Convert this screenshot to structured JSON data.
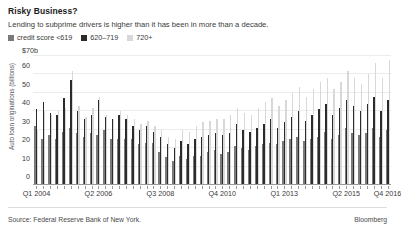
{
  "header": {
    "title": "Risky Business?",
    "subtitle": "Lending to subprime drivers is higher than it has been in more than a decade."
  },
  "legend": {
    "items": [
      {
        "label": "credit score <619",
        "color": "#7a7a7a"
      },
      {
        "label": "620–719",
        "color": "#2b2b2b"
      },
      {
        "label": "720+",
        "color": "#d8d8d8"
      }
    ]
  },
  "footer": {
    "source": "Source: Federal Reserve Bank of New York.",
    "brand": "Bloomberg"
  },
  "chart_data": {
    "type": "bar",
    "title": "Risky Business?",
    "subtitle": "Lending to subprime drivers is higher than it has been in more than a decade.",
    "xlabel": "",
    "ylabel": "Auto loan originations (billions)",
    "ylim": [
      0,
      70
    ],
    "yticks": [
      0,
      10,
      20,
      30,
      40,
      50,
      60,
      70
    ],
    "ytick_labels": [
      "0",
      "10",
      "20",
      "30",
      "40",
      "50",
      "60",
      "$70b"
    ],
    "grid": true,
    "legend_position": "top-left",
    "bar_mode": "grouped",
    "categories": [
      "Q1 2004",
      "Q2 2004",
      "Q3 2004",
      "Q4 2004",
      "Q1 2005",
      "Q2 2005",
      "Q3 2005",
      "Q4 2005",
      "Q1 2006",
      "Q2 2006",
      "Q3 2006",
      "Q4 2006",
      "Q1 2007",
      "Q2 2007",
      "Q3 2007",
      "Q4 2007",
      "Q1 2008",
      "Q2 2008",
      "Q3 2008",
      "Q4 2008",
      "Q1 2009",
      "Q2 2009",
      "Q3 2009",
      "Q4 2009",
      "Q1 2010",
      "Q2 2010",
      "Q3 2010",
      "Q4 2010",
      "Q1 2011",
      "Q2 2011",
      "Q3 2011",
      "Q4 2011",
      "Q1 2012",
      "Q2 2012",
      "Q3 2012",
      "Q4 2012",
      "Q1 2013",
      "Q2 2013",
      "Q3 2013",
      "Q4 2013",
      "Q1 2014",
      "Q2 2014",
      "Q3 2014",
      "Q4 2014",
      "Q1 2015",
      "Q2 2015",
      "Q3 2015",
      "Q4 2015",
      "Q1 2016",
      "Q2 2016",
      "Q3 2016",
      "Q4 2016"
    ],
    "xtick_labels": [
      {
        "label": "Q1 2004",
        "index": 0
      },
      {
        "label": "Q2 2006",
        "index": 9
      },
      {
        "label": "Q3 2008",
        "index": 18
      },
      {
        "label": "Q4 2010",
        "index": 27
      },
      {
        "label": "Q1 2013",
        "index": 36
      },
      {
        "label": "Q2 2015",
        "index": 45
      },
      {
        "label": "Q4 2016",
        "index": 51
      }
    ],
    "series": [
      {
        "name": "credit score <619",
        "color": "#7a7a7a",
        "values": [
          32,
          25,
          27,
          25,
          29,
          31,
          28,
          26,
          28,
          27,
          30,
          25,
          25,
          25,
          25,
          22,
          23,
          23,
          18,
          15,
          13,
          16,
          14,
          16,
          16,
          18,
          19,
          17,
          18,
          21,
          20,
          19,
          21,
          22,
          23,
          22,
          24,
          25,
          26,
          24,
          25,
          26,
          29,
          25,
          27,
          31,
          28,
          27,
          28,
          31,
          26,
          30
        ]
      },
      {
        "name": "620–719",
        "color": "#2b2b2b",
        "values": [
          41,
          45,
          39,
          38,
          47,
          57,
          40,
          36,
          38,
          46,
          37,
          36,
          38,
          36,
          32,
          30,
          32,
          29,
          26,
          22,
          20,
          24,
          22,
          25,
          26,
          27,
          28,
          27,
          28,
          33,
          30,
          29,
          31,
          33,
          36,
          31,
          34,
          37,
          40,
          35,
          38,
          41,
          44,
          38,
          42,
          46,
          43,
          40,
          44,
          48,
          40,
          46
        ]
      },
      {
        "name": "720+",
        "color": "#d8d8d8",
        "values": [
          30,
          40,
          38,
          40,
          42,
          62,
          43,
          37,
          42,
          48,
          38,
          36,
          40,
          38,
          36,
          33,
          35,
          32,
          30,
          26,
          25,
          30,
          29,
          32,
          34,
          35,
          36,
          36,
          38,
          42,
          39,
          38,
          42,
          45,
          47,
          43,
          46,
          50,
          53,
          48,
          52,
          56,
          58,
          52,
          56,
          62,
          58,
          55,
          60,
          66,
          58,
          68
        ]
      }
    ]
  }
}
